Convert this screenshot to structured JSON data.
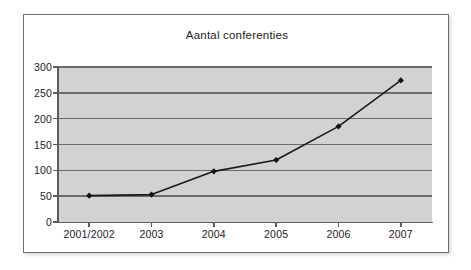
{
  "chart_data": {
    "type": "line",
    "title": "Aantal conferenties",
    "xlabel": "",
    "ylabel": "",
    "categories": [
      "2001/2002",
      "2003",
      "2004",
      "2005",
      "2006",
      "2007"
    ],
    "values": [
      51,
      53,
      98,
      120,
      185,
      274
    ],
    "series": [
      {
        "name": "Aantal conferenties",
        "values": [
          51,
          53,
          98,
          120,
          185,
          274
        ]
      }
    ],
    "ylim": [
      0,
      300
    ],
    "yticks": [
      0,
      50,
      100,
      150,
      200,
      250,
      300
    ],
    "ytick_labels": [
      "0",
      "50",
      "100",
      "150",
      "200",
      "250",
      "300"
    ],
    "grid": true,
    "legend": false,
    "legend_position": "none",
    "marker": "diamond",
    "colors": {
      "line": "#1a1a1a",
      "marker": "#111111",
      "plot_background": "#d2d2d2",
      "gridline": "#6b6b6b",
      "axis": "#5d5d5d",
      "text": "#1c1c1c",
      "frame": "#6f6f6f",
      "page_background": "#ffffff"
    }
  }
}
